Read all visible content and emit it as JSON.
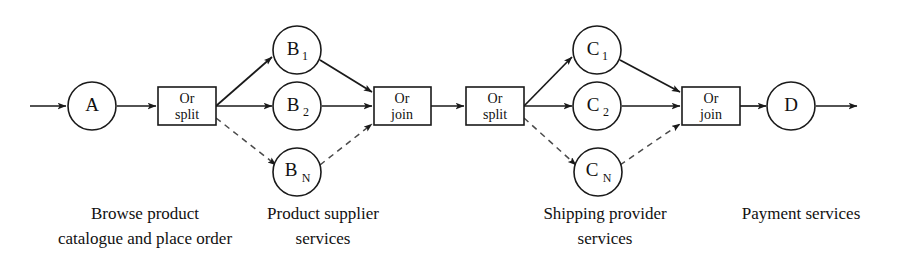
{
  "diagram": {
    "background": "#ffffff",
    "stroke_color": "#1a1a1a",
    "dashed_color": "#4a4a4a",
    "nodes": {
      "a": {
        "label": "A"
      },
      "b1": {
        "label": "B",
        "sub": "1"
      },
      "b2": {
        "label": "B",
        "sub": "2"
      },
      "bn": {
        "label": "B",
        "sub": "N"
      },
      "c1": {
        "label": "C",
        "sub": "1"
      },
      "c2": {
        "label": "C",
        "sub": "2"
      },
      "cn": {
        "label": "C",
        "sub": "N"
      },
      "d": {
        "label": "D"
      }
    },
    "gates": {
      "or_split_1": {
        "line1": "Or",
        "line2": "split"
      },
      "or_join_1": {
        "line1": "Or",
        "line2": "join"
      },
      "or_split_2": {
        "line1": "Or",
        "line2": "split"
      },
      "or_join_2": {
        "line1": "Or",
        "line2": "join"
      }
    },
    "captions": {
      "browse": {
        "line1": "Browse product",
        "line2": "catalogue and place order"
      },
      "supplier": {
        "line1": "Product supplier",
        "line2": "services"
      },
      "shipping": {
        "line1": "Shipping provider",
        "line2": "services"
      },
      "payment": {
        "line1": "Payment services",
        "line2": ""
      }
    }
  }
}
